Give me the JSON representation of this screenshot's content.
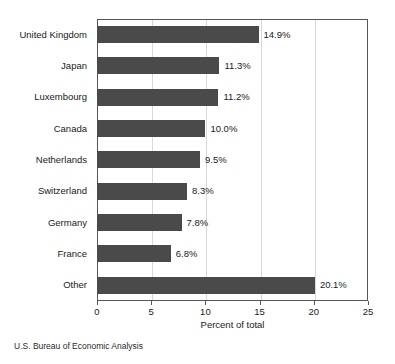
{
  "chart_data": {
    "type": "bar",
    "orientation": "horizontal",
    "title": "",
    "xlabel": "Percent of total",
    "ylabel": "",
    "xlim": [
      0,
      25
    ],
    "xticks": [
      0,
      5,
      10,
      15,
      20,
      25
    ],
    "xtick_labels": [
      "0",
      "5",
      "10",
      "15",
      "20",
      "25"
    ],
    "grid": true,
    "grid_axis": "x",
    "legend": false,
    "categories": [
      "United Kingdom",
      "Japan",
      "Luxembourg",
      "Canada",
      "Netherlands",
      "Switzerland",
      "Germany",
      "France",
      "Other"
    ],
    "values": [
      14.9,
      11.3,
      11.2,
      10.0,
      9.5,
      8.3,
      7.8,
      6.8,
      20.1
    ],
    "data_labels": [
      "14.9%",
      "11.3%",
      "11.2%",
      "10.0%",
      "9.5%",
      "8.3%",
      "7.8%",
      "6.8%",
      "20.1%"
    ],
    "bar_color": "#4a4a4a",
    "frame_color": "#55555a"
  },
  "source": {
    "note": "U.S. Bureau of Economic Analysis"
  }
}
